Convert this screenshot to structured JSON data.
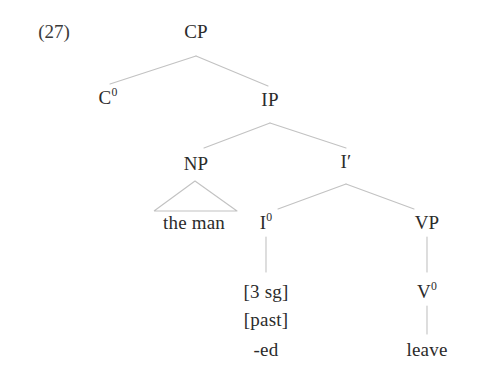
{
  "figure": {
    "example_number": "(27)",
    "type": "syntax-tree",
    "line_color": "#c2c2c2",
    "text_color": "#2b2b2b",
    "background": "#ffffff"
  },
  "nodes": {
    "cp": {
      "label": "CP",
      "x": 196,
      "y": 31
    },
    "c0": {
      "label": "C",
      "sup": "0",
      "x": 108,
      "y": 97
    },
    "ip": {
      "label": "IP",
      "x": 270,
      "y": 99
    },
    "np": {
      "label": "NP",
      "x": 196,
      "y": 163
    },
    "ibar": {
      "label": "I′",
      "x": 346,
      "y": 161
    },
    "theman": {
      "label": "the man",
      "x": 194,
      "y": 222
    },
    "i0": {
      "label": "I",
      "sup": "0",
      "x": 266,
      "y": 222
    },
    "vp": {
      "label": "VP",
      "x": 427,
      "y": 222
    },
    "feat_3sg": {
      "label": "[3 sg]",
      "x": 266,
      "y": 291
    },
    "feat_past": {
      "label": "[past]",
      "x": 266,
      "y": 319
    },
    "ed": {
      "label": "-ed",
      "x": 266,
      "y": 349
    },
    "v0": {
      "label": "V",
      "sup": "0",
      "x": 427,
      "y": 291
    },
    "leave": {
      "label": "leave",
      "x": 427,
      "y": 349
    }
  },
  "edges": [
    {
      "name": "cp-to-c0",
      "x1": 196,
      "y1": 56,
      "x2": 110,
      "y2": 84
    },
    {
      "name": "cp-to-ip",
      "x1": 196,
      "y1": 56,
      "x2": 268,
      "y2": 86
    },
    {
      "name": "ip-to-np",
      "x1": 270,
      "y1": 123,
      "x2": 204,
      "y2": 148
    },
    {
      "name": "ip-to-ibar",
      "x1": 270,
      "y1": 123,
      "x2": 346,
      "y2": 148
    },
    {
      "name": "ibar-to-i0",
      "x1": 346,
      "y1": 184,
      "x2": 278,
      "y2": 209
    },
    {
      "name": "ibar-to-vp",
      "x1": 346,
      "y1": 184,
      "x2": 414,
      "y2": 209
    },
    {
      "name": "i0-to-features",
      "x1": 266,
      "y1": 237,
      "x2": 266,
      "y2": 272
    },
    {
      "name": "vp-to-v0",
      "x1": 427,
      "y1": 237,
      "x2": 427,
      "y2": 272
    },
    {
      "name": "v0-to-leave",
      "x1": 427,
      "y1": 306,
      "x2": 427,
      "y2": 334
    }
  ],
  "triangle": {
    "name": "np-triangle",
    "apex_x": 195,
    "apex_y": 181,
    "left_x": 154,
    "right_x": 237,
    "base_y": 211
  }
}
